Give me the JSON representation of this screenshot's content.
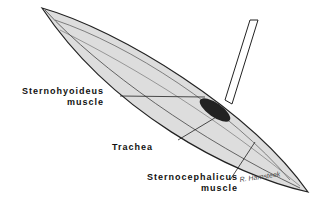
{
  "labels": {
    "sternohyoideus_line1": "Sternohyoideus",
    "sternohyoideus_line2": "muscle",
    "trachea": "Trachea",
    "sternocephalicus_line1": "Sternocephalicus",
    "sternocephalicus_line2": "muscle"
  },
  "signature": "R. Harnsteek"
}
